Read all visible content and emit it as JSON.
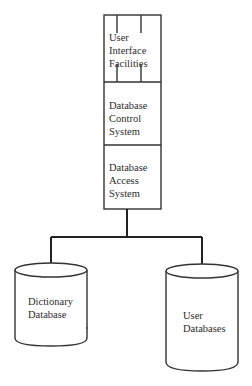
{
  "diagram": {
    "stack": [
      {
        "id": "ui",
        "lines": [
          "User",
          "Interface",
          "Facilities"
        ]
      },
      {
        "id": "control",
        "lines": [
          "Database",
          "Control",
          "System"
        ]
      },
      {
        "id": "access",
        "lines": [
          "Database",
          "Access",
          "System"
        ]
      }
    ],
    "stores": [
      {
        "id": "dictionary",
        "lines": [
          "Dictionary",
          "Database"
        ]
      },
      {
        "id": "user",
        "lines": [
          "User",
          "Databases"
        ]
      }
    ],
    "colors": {
      "line": "#333333",
      "text": "#2c2c2c",
      "background": "#ffffff"
    }
  }
}
